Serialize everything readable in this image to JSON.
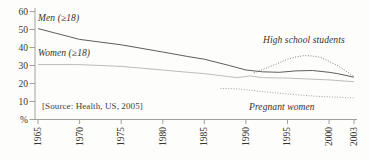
{
  "figure": {
    "source_note": "[Source: Health, US, 2005]"
  },
  "chart_data": {
    "type": "line",
    "title": "",
    "xlabel": "",
    "ylabel": "%",
    "xlim": [
      1965,
      2003
    ],
    "ylim": [
      0,
      60
    ],
    "grid": false,
    "legend_position": "inline-annotations",
    "x_ticks": [
      {
        "year": 1965,
        "label": "1965"
      },
      {
        "year": 1970,
        "label": "1970"
      },
      {
        "year": 1975,
        "label": "1975"
      },
      {
        "year": 1980,
        "label": "1980"
      },
      {
        "year": 1985,
        "label": "1985"
      },
      {
        "year": 1990,
        "label": "1990"
      },
      {
        "year": 1995,
        "label": "1995"
      },
      {
        "year": 2000,
        "label": "2000"
      },
      {
        "year": 2003,
        "label": "2003"
      }
    ],
    "y_ticks": [
      {
        "value": 60,
        "label": "60"
      },
      {
        "value": 50,
        "label": "50"
      },
      {
        "value": 40,
        "label": "40"
      },
      {
        "value": 30,
        "label": "30"
      },
      {
        "value": 20,
        "label": "20"
      },
      {
        "value": 10,
        "label": "10"
      },
      {
        "value": 0,
        "label": "%"
      }
    ],
    "series": [
      {
        "name": "Men (≥18)",
        "style": "solid",
        "color": "#4b4b48",
        "points": [
          [
            1965,
            50.5
          ],
          [
            1970,
            44.5
          ],
          [
            1975,
            41.5
          ],
          [
            1980,
            37.5
          ],
          [
            1983,
            35
          ],
          [
            1985,
            33.5
          ],
          [
            1988,
            30
          ],
          [
            1990,
            27.5
          ],
          [
            1992,
            26.5
          ],
          [
            1994,
            26.2
          ],
          [
            1996,
            27
          ],
          [
            1998,
            27.2
          ],
          [
            2000,
            26.2
          ],
          [
            2001,
            25.5
          ],
          [
            2003,
            23.5
          ]
        ]
      },
      {
        "name": "Women (≥18)",
        "style": "solid",
        "color": "#b5b4b0",
        "points": [
          [
            1965,
            30.5
          ],
          [
            1970,
            30.5
          ],
          [
            1975,
            29.5
          ],
          [
            1980,
            27.5
          ],
          [
            1983,
            26.2
          ],
          [
            1985,
            25.5
          ],
          [
            1988,
            23.8
          ],
          [
            1989,
            23.3
          ],
          [
            1990.5,
            24.2
          ],
          [
            1992,
            23.2
          ],
          [
            1995,
            23
          ],
          [
            2000,
            22
          ],
          [
            2003,
            21
          ]
        ]
      },
      {
        "name": "High school students",
        "style": "dotted",
        "color": "#82817c",
        "points": [
          [
            1991,
            26
          ],
          [
            1993,
            29.5
          ],
          [
            1995,
            33.5
          ],
          [
            1996,
            34.8
          ],
          [
            1997,
            35.5
          ],
          [
            1998,
            35.3
          ],
          [
            1999,
            34.5
          ],
          [
            2001,
            30
          ],
          [
            2003,
            24
          ]
        ]
      },
      {
        "name": "Pregnant women",
        "style": "dotted",
        "color": "#a3a29d",
        "points": [
          [
            1987,
            17.3
          ],
          [
            1989,
            17
          ],
          [
            1991,
            16
          ],
          [
            1993,
            15
          ],
          [
            1995,
            14.2
          ],
          [
            1997,
            13.4
          ],
          [
            1999,
            12.8
          ],
          [
            2001,
            12.4
          ],
          [
            2003,
            12
          ]
        ]
      }
    ],
    "annotations": [
      {
        "text": "Men (≥18)",
        "x": 38,
        "y": 13,
        "style": "italic"
      },
      {
        "text": "Women (≥18)",
        "x": 38,
        "y": 48,
        "style": "italic"
      },
      {
        "text": "High school students",
        "x": 263,
        "y": 35,
        "style": "italic"
      },
      {
        "text": "Pregnant women",
        "x": 249,
        "y": 102,
        "style": "italic"
      },
      {
        "text": "[Source: Health, US, 2005]",
        "x": 42,
        "y": 101,
        "style": "note"
      }
    ]
  }
}
